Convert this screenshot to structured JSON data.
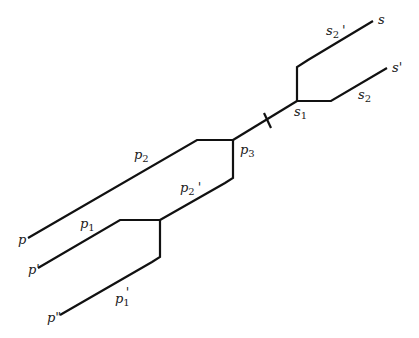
{
  "diagram": {
    "type": "branching-path-diagram",
    "background": "#ffffff",
    "stroke_color": "#111111",
    "labels": {
      "s": "s",
      "s_prime": "s'",
      "s1": "s",
      "s1_sub": "1",
      "s2": "s",
      "s2_sub": "2",
      "s2_prime": "s",
      "s2_prime_sub": "2",
      "s2_prime_mark": "'",
      "p3": "p",
      "p3_sub": "3",
      "p2": "p",
      "p2_sub": "2",
      "p2_prime": "p",
      "p2_prime_sub": "2",
      "p2_prime_mark": "'",
      "p1": "p",
      "p1_sub": "1",
      "p1_prime": "p",
      "p1_prime_sub": "1",
      "p1_prime_mark": "'",
      "p": "p",
      "p_prime": "p'",
      "p_double_prime": "p\""
    },
    "nodes": [
      {
        "id": "s",
        "x": 373,
        "y": 20
      },
      {
        "id": "s_prime",
        "x": 387,
        "y": 68
      },
      {
        "id": "s1",
        "x": 297,
        "y": 101
      },
      {
        "id": "p3",
        "x": 233,
        "y": 140
      },
      {
        "id": "p1_junction",
        "x": 160,
        "y": 220
      },
      {
        "id": "p",
        "x": 28,
        "y": 238
      },
      {
        "id": "p_prime",
        "x": 38,
        "y": 268
      },
      {
        "id": "p_double_prime",
        "x": 60,
        "y": 315
      }
    ],
    "tick_mark": {
      "x": 268,
      "y": 120
    }
  }
}
